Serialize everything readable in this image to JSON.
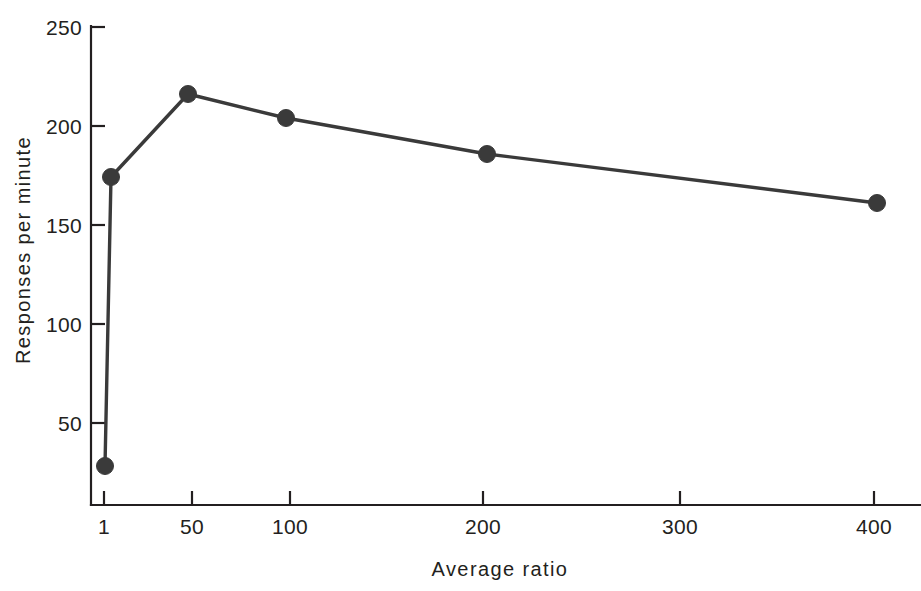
{
  "chart_data": {
    "type": "line",
    "title": "",
    "xlabel": "Average ratio",
    "ylabel": "Responses per minute",
    "x": [
      1,
      5,
      50,
      100,
      200,
      400
    ],
    "values": [
      28,
      173,
      215,
      203,
      185,
      158
    ],
    "series": [
      {
        "name": "Responses per minute",
        "points": [
          {
            "x": 1,
            "y": 28
          },
          {
            "x": 5,
            "y": 173
          },
          {
            "x": 50,
            "y": 215
          },
          {
            "x": 100,
            "y": 203
          },
          {
            "x": 200,
            "y": 185
          },
          {
            "x": 400,
            "y": 158
          }
        ]
      }
    ],
    "xticks": [
      {
        "value": 1,
        "label": "1",
        "px": 104
      },
      {
        "value": 50,
        "label": "50",
        "px": 192
      },
      {
        "value": 100,
        "label": "100",
        "px": 290
      },
      {
        "value": 200,
        "label": "200",
        "px": 483
      },
      {
        "value": 300,
        "label": "300",
        "px": 680
      },
      {
        "value": 400,
        "label": "400",
        "px": 874
      }
    ],
    "yticks": [
      {
        "value": 250,
        "label": "250",
        "px": 27
      },
      {
        "value": 200,
        "label": "200",
        "px": 126
      },
      {
        "value": 150,
        "label": "150",
        "px": 225
      },
      {
        "value": 100,
        "label": "100",
        "px": 324
      },
      {
        "value": 50,
        "label": "50",
        "px": 423
      }
    ],
    "xlim": [
      1,
      420
    ],
    "ylim": [
      0,
      250
    ],
    "grid": false,
    "legend": null,
    "marker": "filled-circle",
    "point_pixels": [
      {
        "cx": 105,
        "cy": 466
      },
      {
        "cx": 111,
        "cy": 177
      },
      {
        "cx": 188,
        "cy": 94
      },
      {
        "cx": 286,
        "cy": 118
      },
      {
        "cx": 487,
        "cy": 154
      },
      {
        "cx": 877,
        "cy": 203
      }
    ],
    "colors": {
      "line": "#3a3a3a",
      "marker": "#3a3a3a",
      "axis": "#231f20",
      "text": "#231f20",
      "background": "#ffffff"
    }
  },
  "labels": {
    "y_250": "250",
    "y_200": "200",
    "y_150": "150",
    "y_100": "100",
    "y_50": "50",
    "x_1": "1",
    "x_50": "50",
    "x_100": "100",
    "x_200": "200",
    "x_300": "300",
    "x_400": "400",
    "x_axis_title": "Average ratio",
    "y_axis_title": "Responses per minute"
  }
}
